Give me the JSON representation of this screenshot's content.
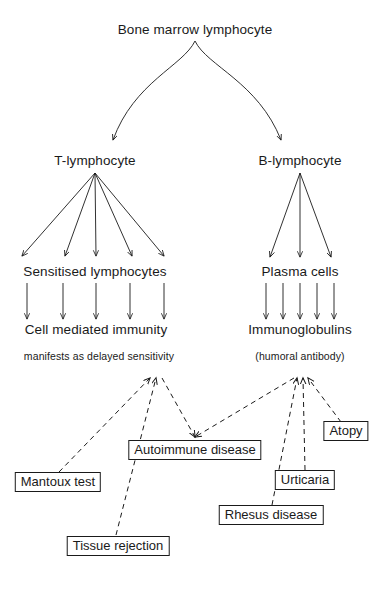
{
  "diagram": {
    "title": "Bone marrow lymphocyte",
    "colors": {
      "stroke": "#1a1a1a",
      "background": "#ffffff",
      "box_border": "#1a1a1a"
    },
    "nodes": {
      "root": "Bone marrow lymphocyte",
      "t_lymphocyte": "T-lymphocyte",
      "b_lymphocyte": "B-lymphocyte",
      "sensitised_lymphocytes": "Sensitised lymphocytes",
      "plasma_cells": "Plasma cells",
      "cell_mediated_immunity": "Cell mediated immunity",
      "immunoglobulins": "Immunoglobulins"
    },
    "notes": {
      "left": "manifests as delayed sensitivity",
      "right": "(humoral antibody)"
    },
    "outcome_boxes": [
      {
        "id": "mantoux-test",
        "label": "Mantoux test"
      },
      {
        "id": "tissue-rejection",
        "label": "Tissue rejection"
      },
      {
        "id": "autoimmune-disease",
        "label": "Autoimmune disease"
      },
      {
        "id": "rhesus-disease",
        "label": "Rhesus disease"
      },
      {
        "id": "urticaria",
        "label": "Urticaria"
      },
      {
        "id": "atopy",
        "label": "Atopy"
      }
    ]
  }
}
